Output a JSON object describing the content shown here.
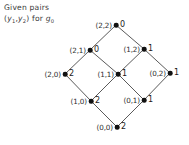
{
  "caption": {
    "line1": "Given pairs",
    "line2_prefix": "(",
    "var1": "y",
    "var1_sub": "1",
    "comma": ",",
    "var2": "y",
    "var2_sub": "2",
    "line2_mid": ") for ",
    "func": "g",
    "func_sub": "0"
  },
  "chart_data": {
    "type": "diagram",
    "title": "Given pairs (y1,y2) for g0",
    "layout": "hasse-lattice-diamond",
    "colors": {
      "node": "#111111",
      "edge": "#3c3c3c",
      "text": "#2e2e2e"
    },
    "nodes": [
      {
        "id": "n22",
        "label": "(2,2)",
        "value": "0",
        "x": 116,
        "y": 25,
        "label_side": "left",
        "value_side": "right"
      },
      {
        "id": "n21",
        "label": "(2,1)",
        "value": "0",
        "x": 90,
        "y": 50,
        "label_side": "left",
        "value_side": "right"
      },
      {
        "id": "n12",
        "label": "(1,2)",
        "value": "1",
        "x": 144,
        "y": 49,
        "label_side": "left",
        "value_side": "right"
      },
      {
        "id": "n20",
        "label": "(2,0)",
        "value": "2",
        "x": 65,
        "y": 74,
        "label_side": "left",
        "value_side": "right"
      },
      {
        "id": "n11",
        "label": "(1,1)",
        "value": "1",
        "x": 118,
        "y": 74,
        "label_side": "left",
        "value_side": "right"
      },
      {
        "id": "n02",
        "label": "(0,2)",
        "value": "1",
        "x": 170,
        "y": 73,
        "label_side": "left",
        "value_side": "right"
      },
      {
        "id": "n10",
        "label": "(1,0)",
        "value": "2",
        "x": 91,
        "y": 101,
        "label_side": "left",
        "value_side": "right"
      },
      {
        "id": "n01",
        "label": "(0,1)",
        "value": "1",
        "x": 144,
        "y": 100,
        "label_side": "left",
        "value_side": "right"
      },
      {
        "id": "n00",
        "label": "(0,0)",
        "value": "2",
        "x": 117,
        "y": 127,
        "label_side": "left",
        "value_side": "right"
      }
    ],
    "edges": [
      {
        "from": "n21",
        "to": "n22"
      },
      {
        "from": "n12",
        "to": "n22"
      },
      {
        "from": "n20",
        "to": "n21"
      },
      {
        "from": "n11",
        "to": "n21"
      },
      {
        "from": "n11",
        "to": "n12"
      },
      {
        "from": "n02",
        "to": "n12"
      },
      {
        "from": "n10",
        "to": "n20"
      },
      {
        "from": "n10",
        "to": "n11"
      },
      {
        "from": "n01",
        "to": "n11"
      },
      {
        "from": "n01",
        "to": "n02"
      },
      {
        "from": "n00",
        "to": "n10"
      },
      {
        "from": "n00",
        "to": "n01"
      }
    ]
  }
}
